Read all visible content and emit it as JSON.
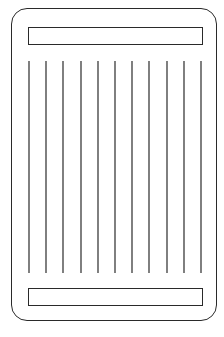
{
  "diagram": {
    "shape": "rounded-rectangle card",
    "stroke_color": "#2a2a2a",
    "background_color": "#ffffff",
    "outer_frame": {
      "x": 11,
      "y": 8,
      "width": 206,
      "height": 313,
      "corner_radius": 16
    },
    "top_bar": {
      "x": 28,
      "y": 27,
      "width": 175,
      "height": 18
    },
    "bottom_bar": {
      "x": 28,
      "y": 288,
      "width": 175,
      "height": 18
    },
    "vertical_lines": {
      "count": 11,
      "y_start": 61,
      "y_end": 273,
      "x_positions": [
        29,
        46,
        63,
        81,
        98,
        115,
        132,
        149,
        167,
        184,
        201
      ]
    }
  }
}
